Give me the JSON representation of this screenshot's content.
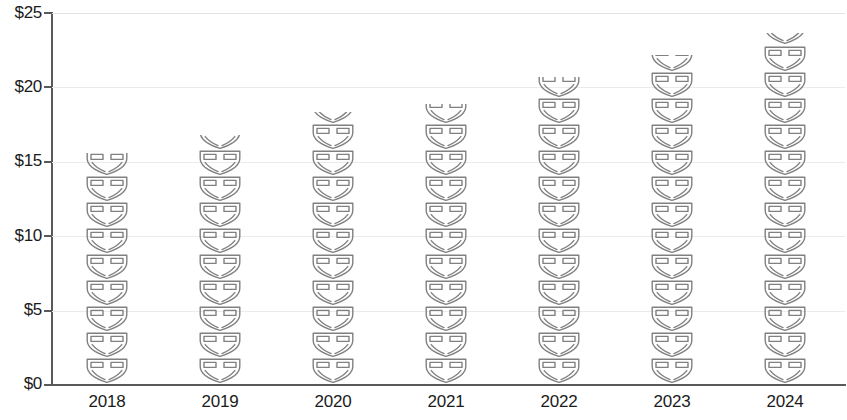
{
  "chart_data": {
    "type": "bar",
    "chart_style": "pictograph",
    "title": "",
    "subtitle": "",
    "xlabel": "",
    "ylabel": "",
    "categories": [
      "2018",
      "2019",
      "2020",
      "2021",
      "2022",
      "2023",
      "2024"
    ],
    "values": [
      15.5,
      16.7,
      18.3,
      18.8,
      20.6,
      22.1,
      23.5
    ],
    "value_prefix": "$",
    "ylim": [
      0,
      25
    ],
    "y_ticks": [
      0,
      5,
      10,
      15,
      20,
      25
    ],
    "y_tick_labels": [
      "$0",
      "$5",
      "$10",
      "$15",
      "$20",
      "$25"
    ],
    "grid": true,
    "grid_axis": "y",
    "legend": false,
    "legend_position": "none",
    "icon": "diaper-icon",
    "icon_unit_value": 1.75,
    "icon_counts": [
      8.86,
      9.54,
      10.46,
      10.74,
      11.77,
      12.63,
      13.43
    ],
    "series": [
      {
        "name": "Value",
        "values": [
          15.5,
          16.7,
          18.3,
          18.8,
          20.6,
          22.1,
          23.5
        ]
      }
    ],
    "colors": {
      "icon_stroke": "#808080",
      "axis": "#595959",
      "grid": "#eceaea",
      "text": "#1b1b1b",
      "background": "#ffffff"
    }
  },
  "axis": {
    "y_labels": [
      "$25",
      "$20",
      "$15",
      "$10",
      "$5",
      "$0"
    ],
    "x_labels": [
      "2018",
      "2019",
      "2020",
      "2021",
      "2022",
      "2023",
      "2024"
    ]
  }
}
